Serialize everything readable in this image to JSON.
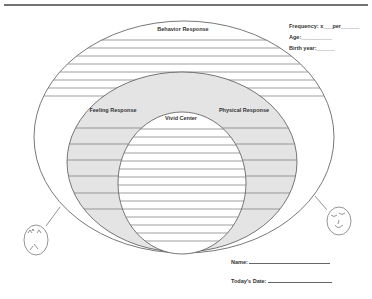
{
  "worksheet": {
    "rings": {
      "outer": {
        "label": "Behavior Response"
      },
      "middle_left": {
        "label": "Feeling Response"
      },
      "middle_right": {
        "label": "Physical Response"
      },
      "inner": {
        "label": "Vivid Center"
      }
    },
    "header_fields": {
      "frequency": {
        "label": "Frequency: x___per______"
      },
      "age": {
        "label": "Age:__________"
      },
      "birth_year": {
        "label": "Birth year:______"
      }
    },
    "footer_fields": {
      "name": {
        "label": "Name:"
      },
      "date": {
        "label": "Today's Date:"
      }
    },
    "faces": {
      "left": {
        "expression": "angry-face"
      },
      "right": {
        "expression": "calm-smiling-face"
      }
    },
    "colors": {
      "stroke": "#555555",
      "middle_fill": "#e4e4e4",
      "inner_fill": "#ffffff",
      "rule_line": "#777777",
      "top_rule": "#444444"
    }
  }
}
